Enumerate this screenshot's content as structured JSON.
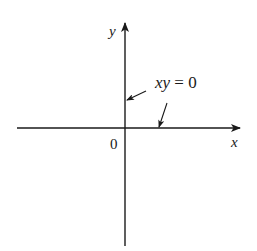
{
  "diagram": {
    "type": "coordinate-axes",
    "axes": {
      "x_label": "x",
      "y_label": "y",
      "origin_label": "0"
    },
    "annotation": {
      "equation_lhs": "xy",
      "equation_eq": " = ",
      "equation_rhs": "0",
      "targets": [
        "y-axis",
        "x-axis"
      ]
    },
    "colors": {
      "stroke": "#1a1a1a",
      "background": "#ffffff"
    }
  }
}
